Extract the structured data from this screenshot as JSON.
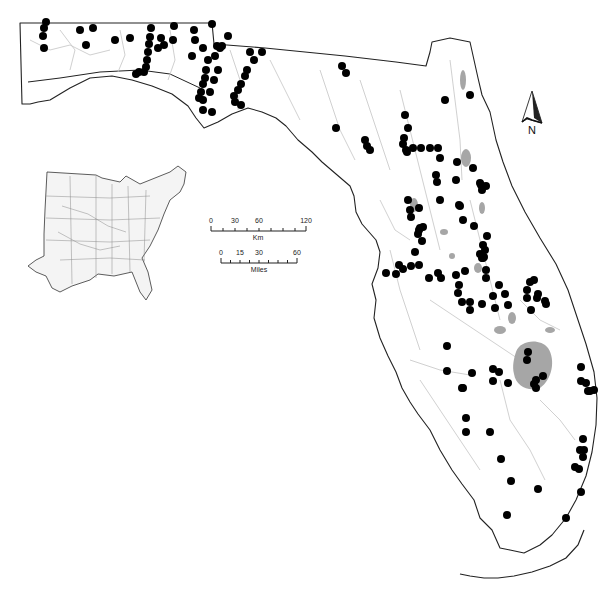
{
  "figure": {
    "point_color": "#000000",
    "lake_color": "#a6a6a6",
    "coast_color": "#222222",
    "river_color": "#bdbdbd"
  },
  "north_arrow": {
    "label": "N"
  },
  "scale_bar": {
    "km": {
      "ticks": [
        "0",
        "30",
        "60",
        "120"
      ],
      "unit": "Km"
    },
    "miles": {
      "ticks": [
        "0",
        "15",
        "30",
        "60"
      ],
      "unit": "Miles"
    }
  },
  "inset": {
    "subject": "Eastern United States with river network"
  },
  "sites": [
    [
      46,
      22
    ],
    [
      44,
      28
    ],
    [
      43,
      36
    ],
    [
      44,
      48
    ],
    [
      80,
      30
    ],
    [
      86,
      45
    ],
    [
      93,
      28
    ],
    [
      115,
      40
    ],
    [
      130,
      38
    ],
    [
      151,
      28
    ],
    [
      150,
      37
    ],
    [
      149,
      44
    ],
    [
      148,
      52
    ],
    [
      147,
      60
    ],
    [
      146,
      67
    ],
    [
      144,
      72
    ],
    [
      139,
      72
    ],
    [
      136,
      74
    ],
    [
      174,
      26
    ],
    [
      212,
      24
    ],
    [
      158,
      48
    ],
    [
      164,
      45
    ],
    [
      161,
      38
    ],
    [
      173,
      40
    ],
    [
      194,
      30
    ],
    [
      195,
      40
    ],
    [
      192,
      56
    ],
    [
      203,
      48
    ],
    [
      208,
      60
    ],
    [
      206,
      70
    ],
    [
      205,
      78
    ],
    [
      203,
      84
    ],
    [
      201,
      92
    ],
    [
      199,
      98
    ],
    [
      203,
      100
    ],
    [
      210,
      92
    ],
    [
      214,
      80
    ],
    [
      218,
      70
    ],
    [
      215,
      56
    ],
    [
      217,
      46
    ],
    [
      220,
      48
    ],
    [
      222,
      46
    ],
    [
      228,
      36
    ],
    [
      250,
      52
    ],
    [
      262,
      52
    ],
    [
      254,
      60
    ],
    [
      247,
      70
    ],
    [
      245,
      76
    ],
    [
      241,
      84
    ],
    [
      238,
      90
    ],
    [
      234,
      96
    ],
    [
      235,
      102
    ],
    [
      241,
      105
    ],
    [
      203,
      110
    ],
    [
      212,
      112
    ],
    [
      342,
      66
    ],
    [
      346,
      73
    ],
    [
      336,
      128
    ],
    [
      365,
      140
    ],
    [
      367,
      146
    ],
    [
      370,
      150
    ],
    [
      405,
      115
    ],
    [
      408,
      128
    ],
    [
      445,
      100
    ],
    [
      470,
      95
    ],
    [
      404,
      138
    ],
    [
      403,
      144
    ],
    [
      406,
      150
    ],
    [
      407,
      152
    ],
    [
      413,
      148
    ],
    [
      421,
      148
    ],
    [
      430,
      148
    ],
    [
      438,
      148
    ],
    [
      440,
      158
    ],
    [
      436,
      175
    ],
    [
      437,
      182
    ],
    [
      457,
      162
    ],
    [
      456,
      180
    ],
    [
      473,
      168
    ],
    [
      481,
      185
    ],
    [
      480,
      183
    ],
    [
      440,
      200
    ],
    [
      459,
      205
    ],
    [
      463,
      220
    ],
    [
      474,
      226
    ],
    [
      486,
      186
    ],
    [
      482,
      190
    ],
    [
      460,
      206
    ],
    [
      408,
      200
    ],
    [
      410,
      210
    ],
    [
      411,
      217
    ],
    [
      419,
      208
    ],
    [
      423,
      227
    ],
    [
      420,
      228
    ],
    [
      419,
      230
    ],
    [
      418,
      234
    ],
    [
      386,
      273
    ],
    [
      396,
      274
    ],
    [
      399,
      265
    ],
    [
      403,
      269
    ],
    [
      411,
      266
    ],
    [
      429,
      278
    ],
    [
      441,
      278
    ],
    [
      438,
      273
    ],
    [
      422,
      241
    ],
    [
      415,
      252
    ],
    [
      419,
      265
    ],
    [
      456,
      275
    ],
    [
      465,
      271
    ],
    [
      486,
      270
    ],
    [
      483,
      258
    ],
    [
      480,
      254
    ],
    [
      482,
      258
    ],
    [
      484,
      257
    ],
    [
      485,
      250
    ],
    [
      483,
      245
    ],
    [
      487,
      236
    ],
    [
      486,
      278
    ],
    [
      458,
      293
    ],
    [
      462,
      302
    ],
    [
      459,
      285
    ],
    [
      493,
      296
    ],
    [
      505,
      294
    ],
    [
      508,
      305
    ],
    [
      470,
      302
    ],
    [
      470,
      310
    ],
    [
      499,
      285
    ],
    [
      482,
      304
    ],
    [
      495,
      308
    ],
    [
      527,
      298
    ],
    [
      530,
      282
    ],
    [
      534,
      280
    ],
    [
      527,
      290
    ],
    [
      531,
      310
    ],
    [
      538,
      294
    ],
    [
      537,
      298
    ],
    [
      546,
      304
    ],
    [
      545,
      301
    ],
    [
      447,
      346
    ],
    [
      447,
      371
    ],
    [
      472,
      373
    ],
    [
      499,
      372
    ],
    [
      493,
      369
    ],
    [
      493,
      381
    ],
    [
      508,
      383
    ],
    [
      527,
      360
    ],
    [
      528,
      352
    ],
    [
      536,
      380
    ],
    [
      536,
      388
    ],
    [
      543,
      376
    ],
    [
      534,
      384
    ],
    [
      581,
      367
    ],
    [
      581,
      381
    ],
    [
      586,
      383
    ],
    [
      588,
      391
    ],
    [
      590,
      391
    ],
    [
      594,
      390
    ],
    [
      462,
      388
    ],
    [
      463,
      388
    ],
    [
      466,
      418
    ],
    [
      490,
      432
    ],
    [
      466,
      432
    ],
    [
      501,
      459
    ],
    [
      538,
      489
    ],
    [
      583,
      439
    ],
    [
      583,
      457
    ],
    [
      580,
      450
    ],
    [
      584,
      450
    ],
    [
      579,
      469
    ],
    [
      575,
      467
    ],
    [
      511,
      481
    ],
    [
      507,
      515
    ],
    [
      581,
      492
    ],
    [
      566,
      518
    ]
  ]
}
